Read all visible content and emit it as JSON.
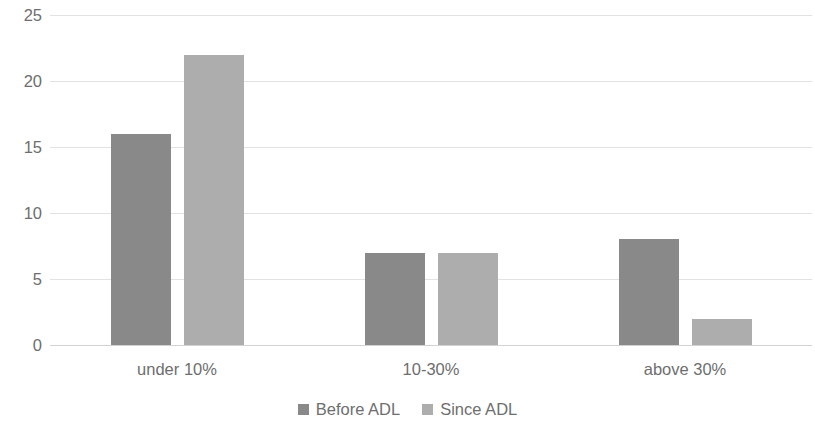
{
  "chart_data": {
    "type": "bar",
    "title": "",
    "subtitle": "",
    "xlabel": "",
    "ylabel": "",
    "categories": [
      "under 10%",
      "10-30%",
      "above 30%"
    ],
    "series": [
      {
        "name": "Before ADL",
        "values": [
          16,
          7,
          8
        ],
        "color": "#898989"
      },
      {
        "name": "Since ADL",
        "values": [
          22,
          7,
          2
        ],
        "color": "#adadad"
      }
    ],
    "ylim": [
      0,
      25
    ],
    "yticks": [
      0,
      5,
      10,
      15,
      20,
      25
    ],
    "ytick_labels": [
      "0",
      "5",
      "10",
      "15",
      "20",
      "25"
    ],
    "grid": "horizontal",
    "legend_position": "bottom",
    "annotations": []
  },
  "axes": {
    "y_tick_labels": [
      "25",
      "20",
      "15",
      "10",
      "5",
      "0"
    ]
  },
  "legend": {
    "items": [
      {
        "label": "Before ADL"
      },
      {
        "label": "Since ADL"
      }
    ]
  }
}
